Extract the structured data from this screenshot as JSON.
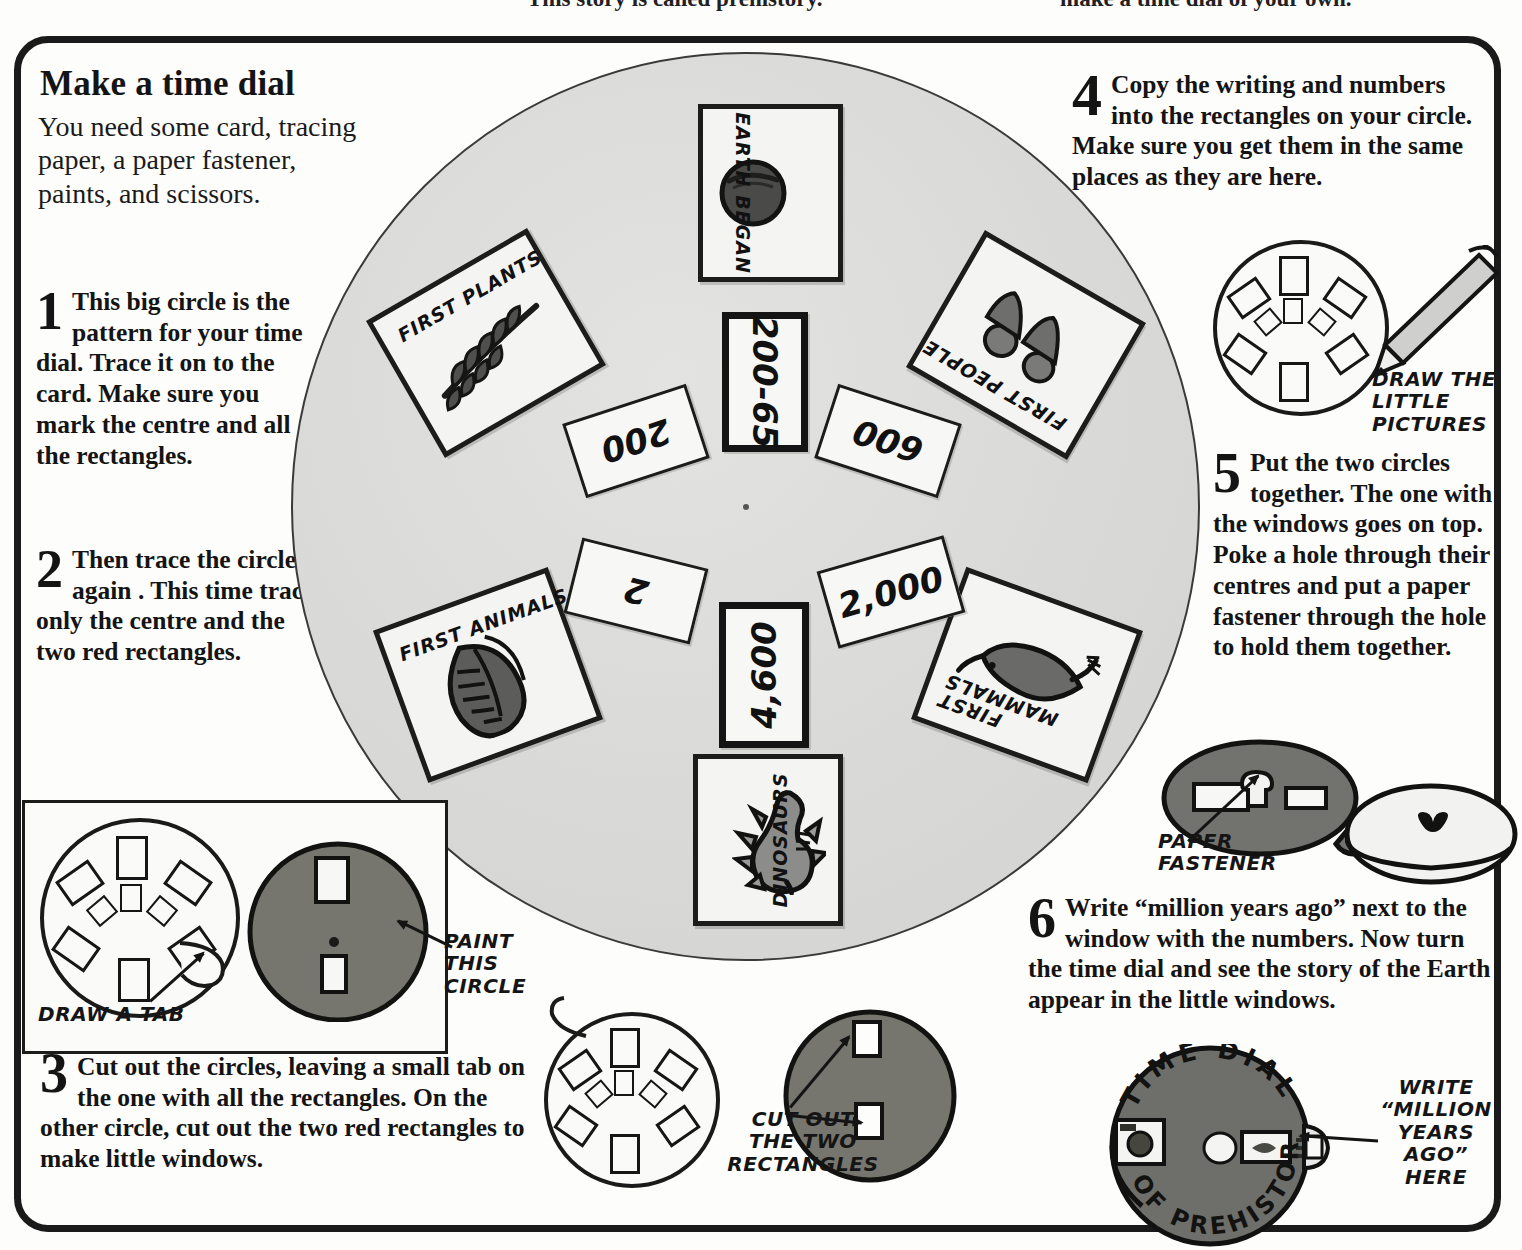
{
  "top_cut_text": {
    "left": "This story is called prehistory.",
    "right": "make a time dial of your own."
  },
  "title": "Make a time dial",
  "intro": "You need some card, tracing paper, a paper fastener, paints, and scissors.",
  "steps": [
    {
      "num": "1",
      "text": "This big circle is the pattern for your time dial. Trace it on to the card. Make sure you mark the centre and all the rectangles."
    },
    {
      "num": "2",
      "text": "Then trace the circle again . This time trace only the centre and the two red rectangles."
    },
    {
      "num": "3",
      "text": "Cut out the circles, leaving a small tab on the one with all the rectangles. On the other circle, cut out the two red rectangles to make little windows."
    },
    {
      "num": "4",
      "text": "Copy the writing and numbers into the rectangles on your circle. Make sure you get them in the same places as they are here."
    },
    {
      "num": "5",
      "text": "Put the two circles together. The one with the windows goes on top. Poke a hole through their centres and put a paper fastener through the hole to hold them together."
    },
    {
      "num": "6",
      "text": "Write “million years ago” next to the window with the numbers. Now turn the time dial and see the story of the Earth appear in the little windows."
    }
  ],
  "dial": {
    "picture_cards": [
      {
        "label": "EARTH BEGAN",
        "icon": "planet-icon",
        "position": "top"
      },
      {
        "label": "FIRST PLANTS",
        "icon": "fern-icon",
        "position": "upper-left"
      },
      {
        "label": "FIRST PEOPLE",
        "icon": "people-icon",
        "position": "upper-right"
      },
      {
        "label": "FIRST ANIMALS",
        "icon": "trilobite-icon",
        "position": "lower-left"
      },
      {
        "label": "FIRST MAMMALS",
        "icon": "mammal-icon",
        "position": "lower-right"
      },
      {
        "label": "DINOSAURS",
        "icon": "stegosaurus-icon",
        "position": "bottom"
      }
    ],
    "number_cards": [
      {
        "value": "200-65",
        "position": "top",
        "highlighted": true
      },
      {
        "value": "200",
        "position": "upper-left",
        "highlighted": false
      },
      {
        "value": "600",
        "position": "upper-right",
        "highlighted": false
      },
      {
        "value": "2",
        "position": "lower-left",
        "highlighted": false
      },
      {
        "value": "2,000",
        "position": "lower-right",
        "highlighted": false
      },
      {
        "value": "4,600",
        "position": "bottom",
        "highlighted": true
      }
    ]
  },
  "annotations": {
    "draw_little_pictures": "DRAW THE\nLITTLE\nPICTURES",
    "draw_a_tab": "DRAW A TAB",
    "paint_this_circle": "PAINT\nTHIS\nCIRCLE",
    "cut_out_two_rectangles": "CUT OUT\nTHE TWO\nRECTANGLES",
    "paper_fastener": "PAPER\nFASTENER",
    "write_million_years": "WRITE\n“MILLION\nYEARS\nAGO”\nHERE"
  },
  "final_dial": {
    "top_arc": "TIME DIAL",
    "bottom_arc": "OF PREHISTORY"
  }
}
